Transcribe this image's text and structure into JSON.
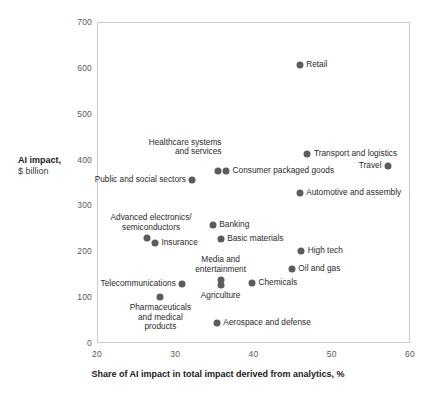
{
  "chart_data": {
    "type": "scatter",
    "title": "",
    "xlabel": "Share of AI impact in total impact derived from analytics, %",
    "ylabel_line1": "AI impact,",
    "ylabel_line2": "$ billion",
    "xlim": [
      20,
      60
    ],
    "ylim": [
      0,
      700
    ],
    "xticks": [
      "20",
      "30",
      "40",
      "50",
      "60"
    ],
    "yticks": [
      "0",
      "100",
      "200",
      "300",
      "400",
      "500",
      "600",
      "700"
    ],
    "grid": false,
    "legend": "none",
    "marker_color": "#5c5c5c",
    "frame_color": "#c9c9c9",
    "points": [
      {
        "label": "Retail",
        "x": 45.9,
        "y": 606,
        "pos": "right"
      },
      {
        "label": "Transport and logistics",
        "x": 46.9,
        "y": 412,
        "pos": "right"
      },
      {
        "label": "Travel",
        "x": 57.2,
        "y": 386,
        "pos": "left"
      },
      {
        "label": "Healthcare systems\nand services",
        "x": 35.4,
        "y": 376,
        "pos": "above-left"
      },
      {
        "label": "Consumer packaged goods",
        "x": 36.5,
        "y": 376,
        "pos": "right"
      },
      {
        "label": "Public and social sectors",
        "x": 32.2,
        "y": 355,
        "pos": "left"
      },
      {
        "label": "Automotive and assembly",
        "x": 45.9,
        "y": 327,
        "pos": "right"
      },
      {
        "label": "Banking",
        "x": 34.8,
        "y": 257,
        "pos": "right"
      },
      {
        "label": "Advanced electronics/\nsemiconductors",
        "x": 26.4,
        "y": 229,
        "pos": "above-right"
      },
      {
        "label": "Insurance",
        "x": 27.4,
        "y": 218,
        "pos": "right"
      },
      {
        "label": "Basic materials",
        "x": 35.8,
        "y": 227,
        "pos": "right"
      },
      {
        "label": "High tech",
        "x": 46.1,
        "y": 201,
        "pos": "right"
      },
      {
        "label": "Oil and gas",
        "x": 44.9,
        "y": 162,
        "pos": "right"
      },
      {
        "label": "Media and\nentertainment",
        "x": 35.8,
        "y": 137,
        "pos": "above"
      },
      {
        "label": "Agriculture",
        "x": 35.8,
        "y": 126,
        "pos": "below"
      },
      {
        "label": "Chemicals",
        "x": 39.8,
        "y": 131,
        "pos": "right"
      },
      {
        "label": "Telecommunications",
        "x": 30.9,
        "y": 129,
        "pos": "left"
      },
      {
        "label": "Pharmaceuticals\nand medical\nproducts",
        "x": 28.1,
        "y": 100,
        "pos": "below"
      },
      {
        "label": "Aerospace and defense",
        "x": 35.3,
        "y": 44,
        "pos": "right"
      }
    ]
  }
}
